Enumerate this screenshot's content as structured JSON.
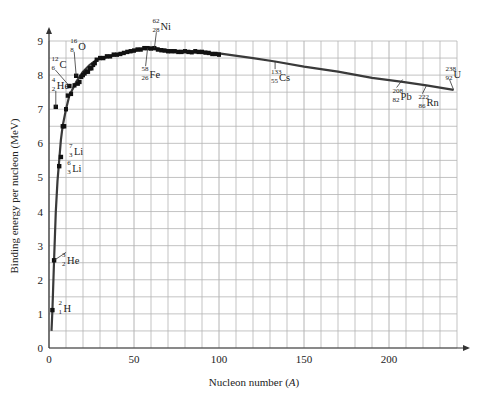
{
  "chart_data": {
    "type": "line",
    "title": "",
    "xlabel": "Nucleon number (A)",
    "ylabel": "Binding energy per nucleon (MeV)",
    "xlim": [
      0,
      240
    ],
    "ylim": [
      0,
      9
    ],
    "x_ticks": [
      0,
      50,
      100,
      150,
      200
    ],
    "y_ticks": [
      0,
      1,
      2,
      3,
      4,
      5,
      6,
      7,
      8,
      9
    ],
    "grid": {
      "on": true,
      "x_step": 10,
      "y_step": 0.5
    },
    "legend": null,
    "series": [
      {
        "name": "Binding energy curve",
        "x": [
          1.5,
          2,
          3,
          4,
          5,
          6,
          7,
          8,
          10,
          12,
          14,
          16,
          20,
          24,
          28,
          32,
          36,
          40,
          45,
          50,
          56,
          62,
          70,
          80,
          90,
          100,
          120,
          133,
          150,
          170,
          190,
          208,
          222,
          238
        ],
        "y": [
          0.5,
          1.1,
          2.6,
          4.0,
          4.9,
          5.5,
          6.1,
          6.5,
          7.0,
          7.4,
          7.6,
          7.8,
          8.1,
          8.3,
          8.45,
          8.5,
          8.55,
          8.6,
          8.65,
          8.7,
          8.78,
          8.79,
          8.72,
          8.68,
          8.66,
          8.64,
          8.5,
          8.4,
          8.25,
          8.1,
          7.92,
          7.8,
          7.7,
          7.57
        ]
      },
      {
        "name": "Measured nuclides (scatter)",
        "x": [
          8,
          9,
          10,
          11,
          13,
          15,
          17,
          18,
          19,
          20,
          21,
          22,
          23,
          24,
          25,
          26,
          27,
          28,
          30,
          32,
          34,
          36,
          38,
          40,
          42,
          44,
          46,
          48,
          50,
          52,
          54,
          56,
          58,
          60,
          62,
          64,
          66,
          68,
          70,
          72,
          74,
          76,
          78,
          80,
          82,
          84,
          86,
          88,
          90,
          92,
          94,
          96,
          98,
          100
        ],
        "y": [
          6.5,
          6.5,
          7.0,
          7.4,
          7.45,
          7.7,
          7.75,
          7.8,
          7.95,
          8.0,
          8.05,
          8.1,
          8.1,
          8.2,
          8.2,
          8.3,
          8.35,
          8.45,
          8.5,
          8.5,
          8.55,
          8.55,
          8.6,
          8.6,
          8.62,
          8.65,
          8.68,
          8.7,
          8.72,
          8.75,
          8.75,
          8.79,
          8.79,
          8.78,
          8.79,
          8.75,
          8.73,
          8.72,
          8.7,
          8.7,
          8.7,
          8.68,
          8.68,
          8.7,
          8.68,
          8.67,
          8.7,
          8.68,
          8.68,
          8.66,
          8.65,
          8.62,
          8.62,
          8.6
        ]
      }
    ],
    "annotations": [
      {
        "id": "H2",
        "mass": "2",
        "z": "1",
        "sym": "H",
        "x": 2,
        "y": 1.11,
        "label_dx": 6,
        "label_dy": 0,
        "leader": false,
        "dot": true
      },
      {
        "id": "He3",
        "mass": "3",
        "z": "2",
        "sym": "He",
        "x": 3,
        "y": 2.57,
        "label_dx": 8,
        "label_dy": 2,
        "leader": true,
        "dot": true
      },
      {
        "id": "Li6",
        "mass": "6",
        "z": "3",
        "sym": "Li",
        "x": 6,
        "y": 5.33,
        "label_dx": 8,
        "label_dy": 4,
        "leader": false,
        "dot": true
      },
      {
        "id": "Li7",
        "mass": "7",
        "z": "3",
        "sym": "Li",
        "x": 7,
        "y": 5.6,
        "label_dx": 8,
        "label_dy": -4,
        "leader": false,
        "dot": true
      },
      {
        "id": "He4",
        "mass": "4",
        "z": "2",
        "sym": "He",
        "x": 4,
        "y": 7.07,
        "label_dx": -4,
        "label_dy": -20,
        "leader": true,
        "dot": true
      },
      {
        "id": "C12",
        "mass": "12",
        "z": "6",
        "sym": "C",
        "x": 12,
        "y": 7.68,
        "label_dx": -18,
        "label_dy": -20,
        "leader": true,
        "dot": true
      },
      {
        "id": "O16",
        "mass": "16",
        "z": "8",
        "sym": "O",
        "x": 16,
        "y": 7.98,
        "label_dx": -6,
        "label_dy": -28,
        "leader": true,
        "dot": true
      },
      {
        "id": "Fe58",
        "mass": "58",
        "z": "26",
        "sym": "Fe",
        "x": 58,
        "y": 8.79,
        "label_dx": -6,
        "label_dy": 28,
        "leader": true,
        "dot": false
      },
      {
        "id": "Ni62",
        "mass": "62",
        "z": "28",
        "sym": "Ni",
        "x": 62,
        "y": 8.79,
        "label_dx": -2,
        "label_dy": -20,
        "leader": true,
        "dot": false
      },
      {
        "id": "Cs133",
        "mass": "133",
        "z": "55",
        "sym": "Cs",
        "x": 133,
        "y": 8.41,
        "label_dx": -4,
        "label_dy": 18,
        "leader": true,
        "dot": false
      },
      {
        "id": "Pb208",
        "mass": "208",
        "z": "82",
        "sym": "Pb",
        "x": 208,
        "y": 7.87,
        "label_dx": -10,
        "label_dy": 18,
        "leader": true,
        "dot": false
      },
      {
        "id": "Rn222",
        "mass": "222",
        "z": "86",
        "sym": "Rn",
        "x": 222,
        "y": 7.69,
        "label_dx": -8,
        "label_dy": 18,
        "leader": true,
        "dot": false
      },
      {
        "id": "U238",
        "mass": "238",
        "z": "92",
        "sym": "U",
        "x": 238,
        "y": 7.57,
        "label_dx": -8,
        "label_dy": -14,
        "leader": true,
        "dot": false
      }
    ]
  },
  "colors": {
    "curve": "#3a3a3a",
    "points": "#111111",
    "grid": "#b4b4b4",
    "axis": "#333333",
    "text": "#222222"
  },
  "axis_labels": {
    "x": "Nucleon number (A)",
    "y": "Binding energy per nucleon (MeV)"
  }
}
